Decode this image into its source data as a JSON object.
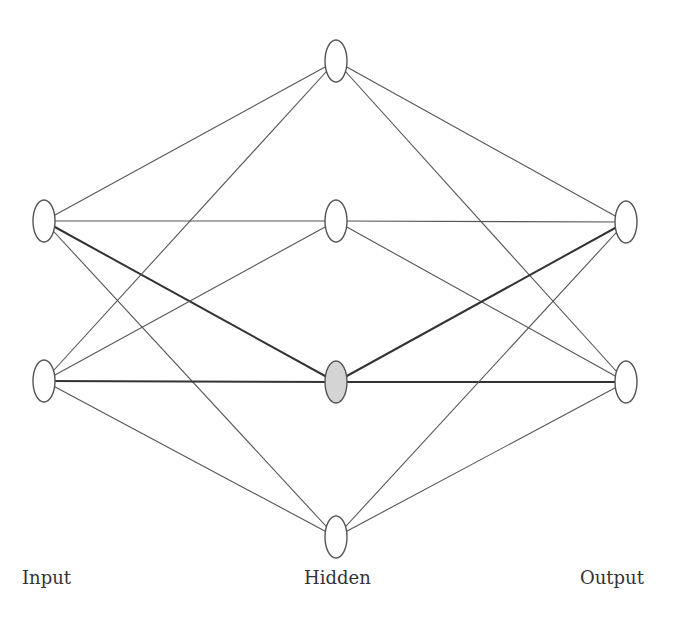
{
  "layers": [
    {
      "name": "Input",
      "label": "Input",
      "nodes": [
        {
          "x": 44,
          "y": 221
        },
        {
          "x": 44,
          "y": 381
        }
      ]
    },
    {
      "name": "Hidden",
      "label": "Hidden",
      "nodes": [
        {
          "x": 336,
          "y": 61
        },
        {
          "x": 336,
          "y": 221
        },
        {
          "x": 336,
          "y": 382,
          "highlighted": true
        },
        {
          "x": 336,
          "y": 537
        }
      ]
    },
    {
      "name": "Output",
      "label": "Output",
      "nodes": [
        {
          "x": 626,
          "y": 222
        },
        {
          "x": 626,
          "y": 382
        }
      ]
    }
  ],
  "highlighted_node": {
    "layer": "Hidden",
    "index": 2,
    "fill": "#d4d4d4"
  },
  "colors": {
    "edge": "#555555",
    "edge_highlight": "#333333",
    "node_stroke": "#555555",
    "node_fill": "#ffffff"
  },
  "labels": {
    "input": "Input",
    "hidden": "Hidden",
    "output": "Output"
  }
}
